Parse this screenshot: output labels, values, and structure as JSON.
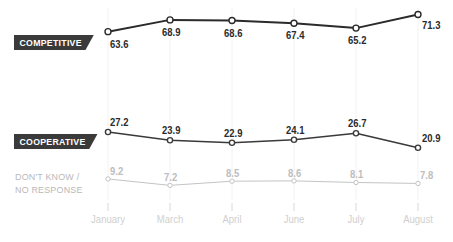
{
  "chart_data": {
    "type": "line",
    "title": "",
    "xlabel": "",
    "ylabel": "",
    "grid": true,
    "legend_position": "inline-left-badges",
    "categories": [
      "January",
      "March",
      "April",
      "June",
      "July",
      "August"
    ],
    "ylim": [
      0,
      80
    ],
    "series": [
      {
        "name": "COMPETITIVE",
        "color": "#2b2b2b",
        "values": [
          63.6,
          68.9,
          68.6,
          67.4,
          65.2,
          71.3
        ],
        "labels": [
          "63.6",
          "68.9",
          "68.6",
          "67.4",
          "65.2",
          "71.3"
        ]
      },
      {
        "name": "COOPERATIVE",
        "color": "#3a3a3a",
        "values": [
          27.2,
          23.9,
          22.9,
          24.1,
          26.7,
          20.9
        ],
        "labels": [
          "27.2",
          "23.9",
          "22.9",
          "24.1",
          "26.7",
          "20.9"
        ]
      },
      {
        "name": "DON'T KNOW / NO RESPONSE",
        "color": "#c4c4c4",
        "values": [
          9.2,
          7.2,
          8.5,
          8.6,
          8.1,
          7.8
        ],
        "labels": [
          "9.2",
          "7.2",
          "8.5",
          "8.6",
          "8.1",
          "7.8"
        ]
      }
    ]
  },
  "labels": {
    "competitive_badge": "COMPETITIVE",
    "cooperative_badge": "COOPERATIVE",
    "dontknow_line1": "DON'T KNOW /",
    "dontknow_line2": "NO RESPONSE"
  },
  "axis": {
    "ticks": [
      "January",
      "March",
      "April",
      "June",
      "July",
      "August"
    ]
  },
  "colors": {
    "background": "#ffffff",
    "badge_bg": "#3a3a3a",
    "badge_text": "#ffffff",
    "series_competitive": "#2b2b2b",
    "series_cooperative": "#3a3a3a",
    "series_dontknow": "#c4c4c4",
    "value_text": "#2b2b2b",
    "value_text_muted": "#bdbdbd",
    "axis_label": "#cfcfcf",
    "gridline": "#f2f2f2"
  }
}
